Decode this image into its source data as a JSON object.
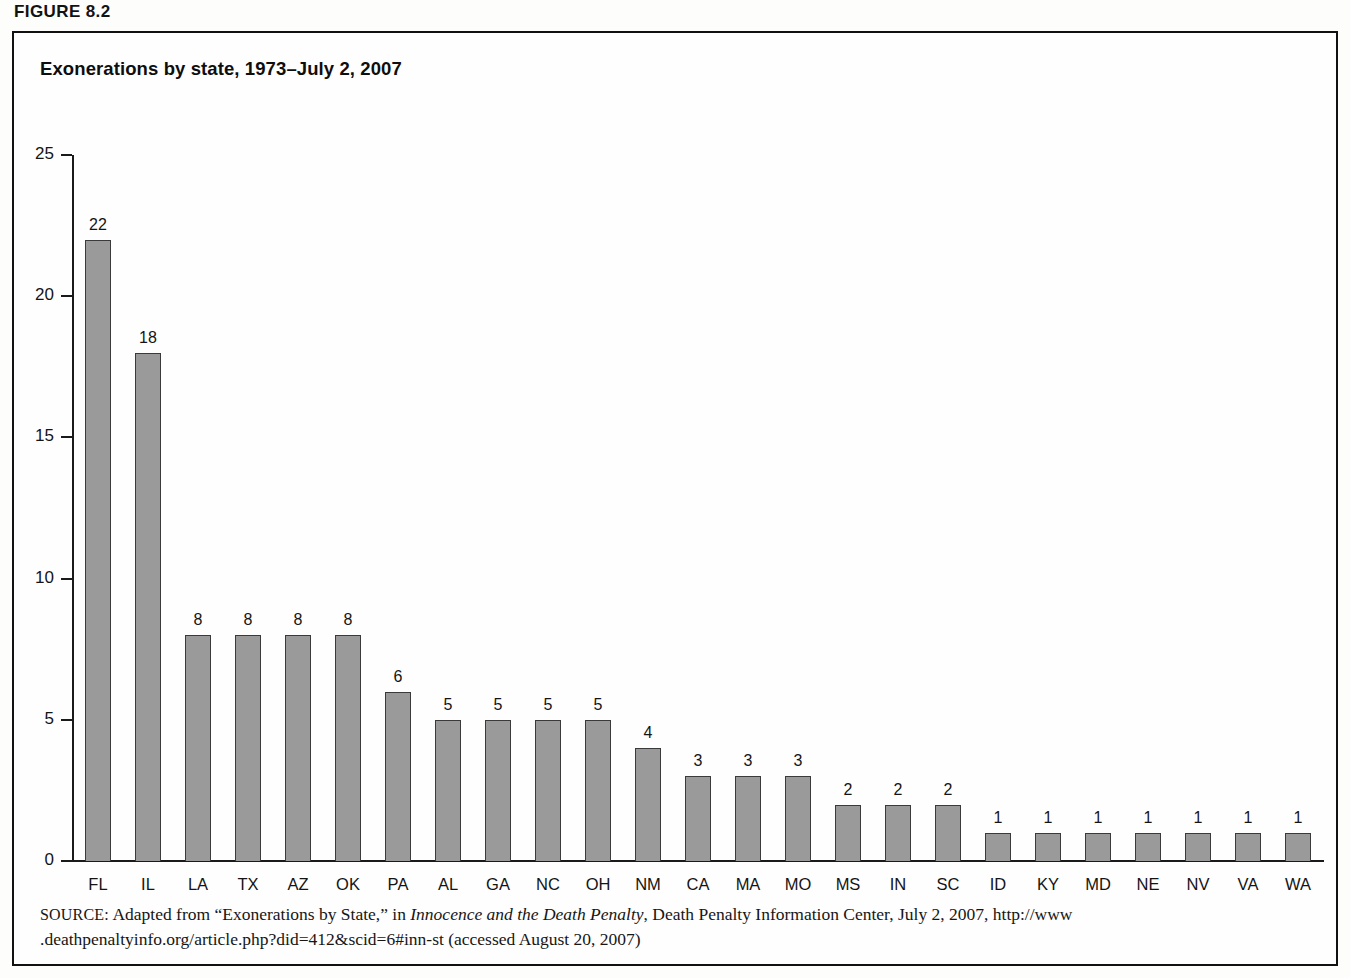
{
  "figure": {
    "label": "FIGURE 8.2"
  },
  "chart_title": "Exonerations by state, 1973–July 2, 2007",
  "source_note": {
    "prefix": "SOURCE:",
    "text_before_italic": " Adapted from “Exonerations by State,” in ",
    "italic_title": "Innocence and the Death Penalty",
    "text_after_italic": ", Death Penalty Information Center, July 2, 2007, http://www .deathpenaltyinfo.org/article.php?did=412&scid=6#inn-st (accessed August 20, 2007)"
  },
  "chart_data": {
    "type": "bar",
    "title": "Exonerations by state, 1973–July 2, 2007",
    "xlabel": "",
    "ylabel": "",
    "ylim": [
      0,
      25
    ],
    "yticks": [
      0,
      5,
      10,
      15,
      20,
      25
    ],
    "ytick_labels": [
      "0",
      "5",
      "10",
      "15",
      "20",
      "25"
    ],
    "grid": false,
    "legend": false,
    "bar_fill_color": "#9a9a9a",
    "bar_border_color": "#3a3a3a",
    "categories": [
      "FL",
      "IL",
      "LA",
      "TX",
      "AZ",
      "OK",
      "PA",
      "AL",
      "GA",
      "NC",
      "OH",
      "NM",
      "CA",
      "MA",
      "MO",
      "MS",
      "IN",
      "SC",
      "ID",
      "KY",
      "MD",
      "NE",
      "NV",
      "VA",
      "WA"
    ],
    "values": [
      22,
      18,
      8,
      8,
      8,
      8,
      6,
      5,
      5,
      5,
      5,
      4,
      3,
      3,
      3,
      2,
      2,
      2,
      1,
      1,
      1,
      1,
      1,
      1,
      1
    ],
    "data_labels": [
      "22",
      "18",
      "8",
      "8",
      "8",
      "8",
      "6",
      "5",
      "5",
      "5",
      "5",
      "4",
      "3",
      "3",
      "3",
      "2",
      "2",
      "2",
      "1",
      "1",
      "1",
      "1",
      "1",
      "1",
      "1"
    ]
  }
}
